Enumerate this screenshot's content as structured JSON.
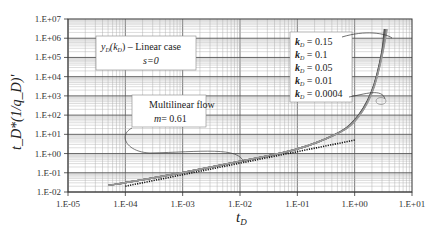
{
  "chart_data": {
    "type": "line",
    "title": "",
    "xlabel": "t_D",
    "ylabel": "t_D*(1/q_D)'",
    "xscale": "log",
    "yscale": "log",
    "xlim": [
      1e-05,
      10
    ],
    "ylim": [
      0.01,
      10000000.0
    ],
    "grid": true,
    "x_tick_labels": [
      "1.E-05",
      "1.E-04",
      "1.E-03",
      "1.E-02",
      "1.E-01",
      "1.E+00",
      "1.E+01"
    ],
    "y_tick_labels": [
      "1.E+07",
      "1.E+06",
      "1.E+05",
      "1.E+04",
      "1.E+03",
      "1.E+02",
      "1.E+01",
      "1.E+00",
      "1.E-01",
      "1.E-02"
    ],
    "series": [
      {
        "name": "k_D = 0.15",
        "x": [
          5e-05,
          0.0001,
          0.001,
          0.01,
          0.1,
          0.5,
          1,
          2,
          3,
          3.3
        ],
        "y": [
          0.022,
          0.03,
          0.1,
          0.4,
          1.5,
          10,
          45,
          1200,
          150000.0,
          3000000.0
        ]
      },
      {
        "name": "k_D = 0.1",
        "x": [
          5e-05,
          0.0001,
          0.001,
          0.01,
          0.1,
          0.5,
          1,
          2,
          3,
          3.4
        ],
        "y": [
          0.022,
          0.03,
          0.1,
          0.4,
          1.5,
          10,
          42,
          1100,
          130000.0,
          3000000.0
        ]
      },
      {
        "name": "k_D = 0.05",
        "x": [
          5e-05,
          0.0001,
          0.001,
          0.01,
          0.1,
          0.5,
          1,
          2,
          3,
          3.5
        ],
        "y": [
          0.022,
          0.03,
          0.1,
          0.4,
          1.5,
          10,
          40,
          1000,
          110000.0,
          3000000.0
        ]
      },
      {
        "name": "k_D = 0.01",
        "x": [
          5e-05,
          0.0001,
          0.001,
          0.01,
          0.1,
          0.5,
          1,
          2,
          3,
          3.6
        ],
        "y": [
          0.022,
          0.03,
          0.1,
          0.4,
          1.5,
          10,
          38,
          950,
          100000.0,
          3000000.0
        ]
      },
      {
        "name": "k_D = 0.0004",
        "x": [
          5e-05,
          0.0001,
          0.001,
          0.01,
          0.1,
          0.5,
          1,
          2,
          3,
          3.7
        ],
        "y": [
          0.022,
          0.03,
          0.1,
          0.4,
          1.5,
          10,
          36,
          900,
          90000.0,
          3000000.0
        ]
      },
      {
        "name": "Multilinear flow (m = 0.61)",
        "style": "dotted",
        "x": [
          0.0001,
          1
        ],
        "y": [
          0.02,
          5
        ]
      }
    ],
    "annotations": [
      {
        "text": "y_D(k_D) – Linear case",
        "subtext": "s=0"
      },
      {
        "text": "Multilinear flow",
        "subtext": "m= 0.61"
      }
    ],
    "legend_position": "upper right (inside plot)"
  },
  "annotation_box": {
    "line1_main": "y",
    "line1_sub": "D",
    "line1_paren_open": "(k",
    "line1_sub2": "D",
    "line1_rest": ") – Linear case",
    "line2": "s=0"
  },
  "flow_box": {
    "line1": "Multilinear flow",
    "line2_m": "m",
    "line2_rest": "= 0.61"
  },
  "legend": {
    "items": [
      {
        "k": "k",
        "sub": "D",
        "value": " = 0.15"
      },
      {
        "k": "k",
        "sub": "D",
        "value": " = 0.1"
      },
      {
        "k": "k",
        "sub": "D",
        "value": " = 0.05"
      },
      {
        "k": "k",
        "sub": "D",
        "value": " = 0.01"
      },
      {
        "k": "k",
        "sub": "D",
        "value": " = 0.0004"
      }
    ]
  },
  "axes": {
    "x_label_main": "t",
    "x_label_sub": "D",
    "y_label": "t_D*(1/q_D)'"
  }
}
